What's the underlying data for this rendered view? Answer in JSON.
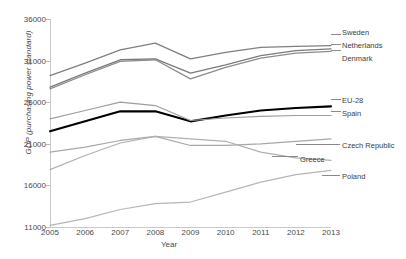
{
  "chart_data": {
    "type": "line",
    "title": "",
    "xlabel": "Year",
    "ylabel": "GDP (purchasing power standard)",
    "x": [
      2005,
      2006,
      2007,
      2008,
      2009,
      2010,
      2011,
      2012,
      2013
    ],
    "xlim": [
      2005,
      2013
    ],
    "ylim": [
      11000,
      36000
    ],
    "yticks": [
      11000,
      16000,
      21000,
      26000,
      31000,
      36000
    ],
    "xticks": [
      "2005",
      "2006",
      "2007",
      "2008",
      "2009",
      "2010",
      "2011",
      "2012",
      "2013"
    ],
    "grid": false,
    "legend_position": "right-inline-labels",
    "series": [
      {
        "name": "Sweden",
        "color": "#7f7f7f",
        "width": 1.3,
        "values": [
          29200,
          30700,
          32300,
          33100,
          31200,
          32000,
          32600,
          32700,
          32800
        ]
      },
      {
        "name": "Netherlands",
        "color": "#7a7a7a",
        "width": 1.3,
        "values": [
          27800,
          29500,
          31100,
          31200,
          29500,
          30500,
          31600,
          32200,
          32400
        ]
      },
      {
        "name": "Denmark",
        "color": "#8c8c8c",
        "width": 1.3,
        "values": [
          27600,
          29300,
          30900,
          31100,
          28800,
          30200,
          31300,
          31900,
          32100
        ]
      },
      {
        "name": "EU-28",
        "color": "#000000",
        "width": 2.1,
        "values": [
          22500,
          23700,
          24900,
          24900,
          23700,
          24400,
          25000,
          25300,
          25500
        ]
      },
      {
        "name": "Spain",
        "color": "#9e9e9e",
        "width": 1.2,
        "values": [
          24000,
          25000,
          26000,
          25600,
          23800,
          24100,
          24300,
          24400,
          24400
        ]
      },
      {
        "name": "Czech Republic",
        "color": "#a8a8a8",
        "width": 1.2,
        "values": [
          20000,
          20600,
          21400,
          21900,
          20800,
          20800,
          21000,
          21300,
          21600
        ]
      },
      {
        "name": "Greece",
        "color": "#b0b0b0",
        "width": 1.2,
        "values": [
          17900,
          19600,
          21100,
          21900,
          21600,
          21300,
          20000,
          19300,
          19000
        ]
      },
      {
        "name": "Poland",
        "color": "#b5b5b5",
        "width": 1.2,
        "values": [
          11200,
          12000,
          13100,
          13800,
          14000,
          15200,
          16400,
          17300,
          17800
        ]
      }
    ],
    "annotations": [
      {
        "name": "Sweden",
        "label": "Sweden"
      },
      {
        "name": "Netherlands",
        "label": "Netherlands"
      },
      {
        "name": "Denmark",
        "label": "Denmark"
      },
      {
        "name": "EU-28",
        "label": "EU-28"
      },
      {
        "name": "Spain",
        "label": "Spain"
      },
      {
        "name": "Czech Republic",
        "label": "Czech Republic"
      },
      {
        "name": "Greece",
        "label": "Greece"
      },
      {
        "name": "Poland",
        "label": "Poland"
      }
    ]
  }
}
